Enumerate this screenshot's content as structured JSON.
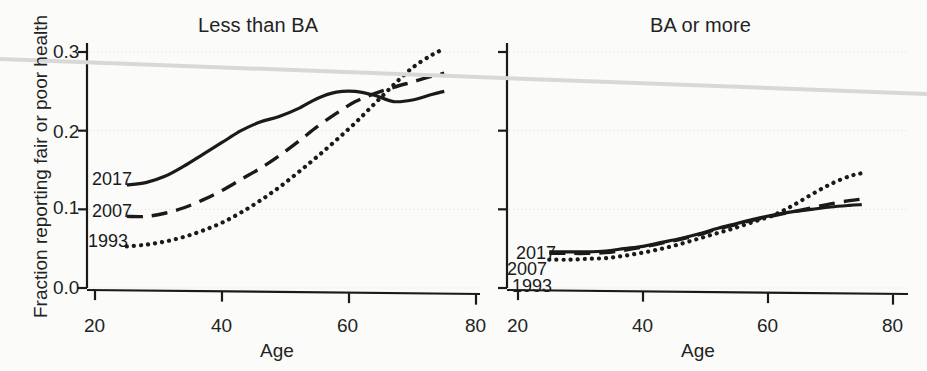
{
  "figure": {
    "ylabel": "Fraction reporting fair or poor health",
    "xlabel_left": "Age",
    "xlabel_right": "Age",
    "background_color": "#fbfbfa",
    "ink_color": "#1a1a1a",
    "gridline_color": "#dcdcdc",
    "artifact_line_color": "#d8d8d8"
  },
  "panels": {
    "left": {
      "title": "Less than BA",
      "y_ticks": [
        "0.3",
        "0.2",
        "0.1",
        "0.0"
      ],
      "x_ticks": [
        "20",
        "40",
        "60",
        "80"
      ],
      "series_tags": [
        "2017",
        "2007",
        "1993"
      ]
    },
    "right": {
      "title": "BA or more",
      "y_ticks": [
        "",
        "",
        "",
        ""
      ],
      "x_ticks": [
        "20",
        "40",
        "60",
        "80"
      ],
      "series_tags": [
        "2017",
        "2007",
        "1993"
      ]
    }
  },
  "chart_data": {
    "type": "line",
    "xlabel": "Age",
    "ylabel": "Fraction reporting fair or poor health",
    "xlim": [
      20,
      80
    ],
    "ylim": [
      0.0,
      0.32
    ],
    "xticks": [
      20,
      40,
      60,
      80
    ],
    "yticks": [
      0.0,
      0.1,
      0.2,
      0.3
    ],
    "grid": "horizontal-dotted",
    "legend": "inline-left-labels",
    "panels": [
      {
        "name": "Less than BA",
        "series": [
          {
            "name": "2017",
            "style": "solid",
            "x": [
              25,
              28,
              31,
              34,
              37,
              40,
              43,
              46,
              49,
              52,
              55,
              58,
              61,
              64,
              67,
              70,
              73,
              75
            ],
            "y": [
              0.131,
              0.134,
              0.142,
              0.155,
              0.17,
              0.185,
              0.2,
              0.211,
              0.218,
              0.228,
              0.241,
              0.249,
              0.25,
              0.245,
              0.237,
              0.239,
              0.246,
              0.25
            ]
          },
          {
            "name": "2007",
            "style": "dashed",
            "x": [
              25,
              28,
              31,
              34,
              37,
              40,
              43,
              46,
              49,
              52,
              55,
              58,
              61,
              64,
              67,
              70,
              73,
              75
            ],
            "y": [
              0.091,
              0.091,
              0.095,
              0.102,
              0.112,
              0.124,
              0.138,
              0.152,
              0.168,
              0.186,
              0.205,
              0.222,
              0.237,
              0.247,
              0.255,
              0.262,
              0.269,
              0.273
            ]
          },
          {
            "name": "1993",
            "style": "dotted",
            "x": [
              25,
              28,
              31,
              34,
              37,
              40,
              43,
              46,
              49,
              52,
              55,
              58,
              61,
              64,
              67,
              70,
              73,
              75
            ],
            "y": [
              0.053,
              0.055,
              0.059,
              0.065,
              0.073,
              0.083,
              0.096,
              0.111,
              0.128,
              0.147,
              0.167,
              0.188,
              0.21,
              0.234,
              0.258,
              0.28,
              0.296,
              0.304
            ]
          }
        ]
      },
      {
        "name": "BA or more",
        "series": [
          {
            "name": "2017",
            "style": "solid",
            "x": [
              25,
              28,
              31,
              34,
              37,
              40,
              43,
              46,
              49,
              52,
              55,
              58,
              61,
              64,
              67,
              70,
              73,
              75
            ],
            "y": [
              0.046,
              0.046,
              0.046,
              0.047,
              0.05,
              0.053,
              0.058,
              0.063,
              0.069,
              0.076,
              0.082,
              0.088,
              0.093,
              0.097,
              0.1,
              0.103,
              0.105,
              0.106
            ]
          },
          {
            "name": "2007",
            "style": "dashed",
            "x": [
              25,
              28,
              31,
              34,
              37,
              40,
              43,
              46,
              49,
              52,
              55,
              58,
              61,
              64,
              67,
              70,
              73,
              75
            ],
            "y": [
              0.044,
              0.044,
              0.044,
              0.045,
              0.048,
              0.052,
              0.057,
              0.062,
              0.068,
              0.075,
              0.081,
              0.087,
              0.092,
              0.097,
              0.102,
              0.107,
              0.111,
              0.113
            ]
          },
          {
            "name": "1993",
            "style": "dotted",
            "x": [
              25,
              28,
              31,
              34,
              37,
              40,
              43,
              46,
              49,
              52,
              55,
              58,
              61,
              64,
              67,
              70,
              73,
              75
            ],
            "y": [
              0.036,
              0.036,
              0.037,
              0.038,
              0.041,
              0.045,
              0.05,
              0.056,
              0.063,
              0.07,
              0.077,
              0.085,
              0.093,
              0.105,
              0.119,
              0.132,
              0.142,
              0.146
            ]
          }
        ]
      }
    ]
  }
}
